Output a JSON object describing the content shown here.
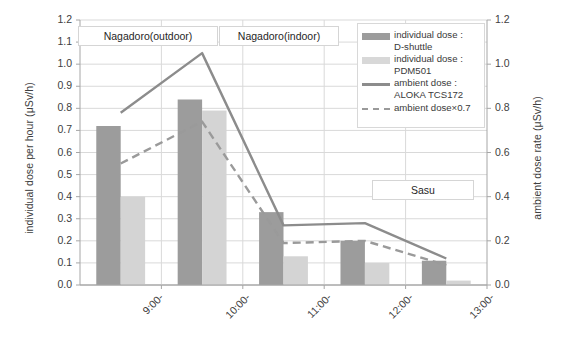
{
  "chart_data": {
    "type": "bar",
    "title": "",
    "categories": [
      "9:00-",
      "10:00-",
      "11:00-",
      "12:00-",
      "13:00-"
    ],
    "xlabel": "",
    "ylabel": "individual dose per hour (μSv/h)",
    "ylabel_right": "ambient dose rate (μSv/h)",
    "ylim": [
      0.0,
      1.2
    ],
    "ylim_right": [
      0.0,
      1.2
    ],
    "grid": true,
    "legend_position": "top-right",
    "yticks_left": [
      "0.0",
      "0.1",
      "0.2",
      "0.3",
      "0.4",
      "0.5",
      "0.6",
      "0.7",
      "0.8",
      "0.9",
      "1.0",
      "1.1",
      "1.2"
    ],
    "yticks_right": [
      "0.0",
      "0.2",
      "0.4",
      "0.6",
      "0.8",
      "1.0",
      "1.2"
    ],
    "series": [
      {
        "name": "individual dose :\nD-shuttle",
        "kind": "bar",
        "color": "#9c9c9c",
        "axis": "left",
        "values": [
          0.72,
          0.84,
          0.33,
          0.2,
          0.11
        ]
      },
      {
        "name": "individual dose :\nPDM501",
        "kind": "bar",
        "color": "#d4d4d4",
        "axis": "left",
        "values": [
          0.4,
          0.79,
          0.13,
          0.1,
          0.02
        ]
      },
      {
        "name": "ambient dose :\nALOKA TCS172",
        "kind": "line",
        "style": "solid",
        "color": "#8c8c8c",
        "axis": "right",
        "values": [
          0.78,
          1.05,
          0.27,
          0.28,
          0.12
        ]
      },
      {
        "name": "ambient dose×0.7",
        "kind": "line",
        "style": "dashed",
        "color": "#9a9a9a",
        "axis": "right",
        "values": [
          0.55,
          0.74,
          0.19,
          0.2,
          0.09
        ]
      }
    ],
    "annotations": [
      {
        "label": "Nagadoro(outdoor)",
        "x": 78,
        "y": 26,
        "w": 140,
        "h": 20
      },
      {
        "label": "Nagadoro(indoor)",
        "x": 219,
        "y": 26,
        "w": 120,
        "h": 20
      },
      {
        "label": "Sasu",
        "x": 372,
        "y": 180,
        "w": 102,
        "h": 20
      }
    ]
  },
  "legend": {
    "items": [
      {
        "key": "swatch-dark",
        "text": "individual dose :\nD-shuttle"
      },
      {
        "key": "swatch-light",
        "text": "individual dose :\nPDM501"
      },
      {
        "key": "line-solid",
        "text": "ambient dose :\nALOKA TCS172"
      },
      {
        "key": "line-dashed",
        "text": "ambient dose×0.7"
      }
    ]
  }
}
